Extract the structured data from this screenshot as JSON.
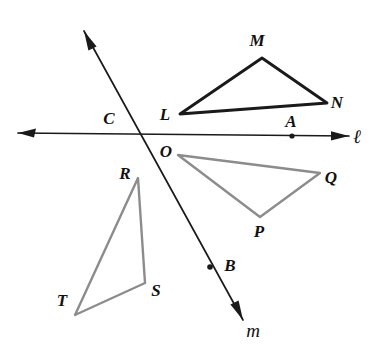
{
  "figure": {
    "background_color": "#ffffff",
    "width": 379,
    "height": 353
  },
  "style": {
    "dark_stroke": "#1a1a1a",
    "gray_stroke": "#8c8c8c",
    "label_color": "#111111",
    "dark_stroke_width": 2.6,
    "gray_stroke_width": 2.2,
    "line_stroke_width": 1.6
  },
  "lines": [
    {
      "id": "line-l",
      "label": "ℓ",
      "label_x": 355,
      "label_y": 143,
      "x1": 18,
      "y1": 133,
      "x2": 349,
      "y2": 136,
      "arrow_start": true,
      "arrow_end": true,
      "color": "#1a1a1a"
    },
    {
      "id": "line-m",
      "label": "m",
      "label_x": 248,
      "label_y": 336,
      "x1": 84,
      "y1": 31,
      "x2": 243,
      "y2": 320,
      "arrow_start": true,
      "arrow_end": true,
      "color": "#1a1a1a"
    }
  ],
  "triangles": [
    {
      "id": "triangle-LMN",
      "name": "triangle-lmn",
      "color": "#1a1a1a",
      "stroke_width": 2.8,
      "points": "180,114 262,58 327,103",
      "vertices": [
        {
          "label": "L",
          "x": 180,
          "y": 114,
          "label_x": 165,
          "label_y": 120
        },
        {
          "label": "M",
          "x": 262,
          "y": 58,
          "label_x": 257,
          "label_y": 46
        },
        {
          "label": "N",
          "x": 327,
          "y": 103,
          "label_x": 332,
          "label_y": 108
        }
      ]
    },
    {
      "id": "triangle-OQP",
      "name": "triangle-oqp",
      "color": "#8c8c8c",
      "stroke_width": 2.4,
      "points": "178,155 320,173 260,217",
      "vertices": [
        {
          "label": "O",
          "x": 178,
          "y": 155,
          "label_x": 161,
          "label_y": 156
        },
        {
          "label": "Q",
          "x": 320,
          "y": 173,
          "label_x": 325,
          "label_y": 182
        },
        {
          "label": "P",
          "x": 260,
          "y": 217,
          "label_x": 255,
          "label_y": 236
        }
      ]
    },
    {
      "id": "triangle-RST",
      "name": "triangle-rst",
      "color": "#8c8c8c",
      "stroke_width": 2.4,
      "points": "138,178 145,283 75,315",
      "vertices": [
        {
          "label": "R",
          "x": 138,
          "y": 178,
          "label_x": 121,
          "label_y": 178
        },
        {
          "label": "S",
          "x": 145,
          "y": 283,
          "label_x": 150,
          "label_y": 296
        },
        {
          "label": "T",
          "x": 75,
          "y": 315,
          "label_x": 57,
          "label_y": 305
        }
      ]
    }
  ],
  "marked_points": [
    {
      "label": "A",
      "x": 292,
      "y": 136,
      "label_x": 286,
      "label_y": 127,
      "on_line": "line-l",
      "dot": true
    },
    {
      "label": "B",
      "x": 210,
      "y": 267,
      "label_x": 224,
      "label_y": 270,
      "on_line": "line-m",
      "dot": true
    },
    {
      "label": "C",
      "x": 113,
      "y": 134,
      "label_x": 103,
      "label_y": 123,
      "on_line": "line-l",
      "dot": false
    }
  ]
}
